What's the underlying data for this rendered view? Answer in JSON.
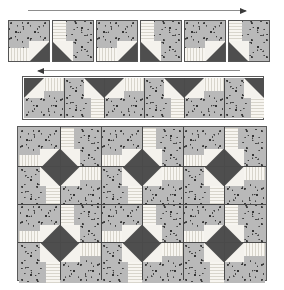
{
  "diagram": {
    "caption": "",
    "fabrics": {
      "print_label": "gray floral print",
      "print_color": "#b9b9b9",
      "stripe_label": "cream stripe",
      "stripe_color": "#f2f0ea",
      "dark_label": "dark gray solid",
      "dark_color": "#4e4e4e",
      "outline_color": "#555555"
    }
  },
  "step1": {
    "name": "single-blocks-row",
    "arrow": {
      "name": "sewing-direction-arrow",
      "direction": "right",
      "label": ""
    },
    "block_count": 6,
    "blocks": [
      {
        "id": "b1",
        "rotation": 0,
        "label": ""
      },
      {
        "id": "b2",
        "rotation": 90,
        "label": ""
      },
      {
        "id": "b3",
        "rotation": 0,
        "label": ""
      },
      {
        "id": "b4",
        "rotation": 90,
        "label": ""
      },
      {
        "id": "b5",
        "rotation": 0,
        "label": ""
      },
      {
        "id": "b6",
        "rotation": 90,
        "label": ""
      }
    ]
  },
  "step2": {
    "name": "joined-pairs-row",
    "arrow": {
      "name": "sewing-direction-arrow",
      "direction": "left",
      "label": ""
    },
    "block_count": 6,
    "pair_count": 3,
    "blocks": [
      {
        "id": "c1",
        "rotation": 180,
        "label": ""
      },
      {
        "id": "c2",
        "rotation": 270,
        "label": ""
      },
      {
        "id": "c3",
        "rotation": 180,
        "label": ""
      },
      {
        "id": "c4",
        "rotation": 270,
        "label": ""
      },
      {
        "id": "c5",
        "rotation": 180,
        "label": ""
      },
      {
        "id": "c6",
        "rotation": 270,
        "label": ""
      }
    ]
  },
  "step3": {
    "name": "assembled-quilt-top",
    "columns": 6,
    "rows": 4,
    "block_count": 24,
    "pinwheel_count": 6,
    "grid": [
      [
        {
          "rotation": 0
        },
        {
          "rotation": 90
        },
        {
          "rotation": 0
        },
        {
          "rotation": 90
        },
        {
          "rotation": 0
        },
        {
          "rotation": 90
        }
      ],
      [
        {
          "rotation": 270
        },
        {
          "rotation": 180
        },
        {
          "rotation": 270
        },
        {
          "rotation": 180
        },
        {
          "rotation": 270
        },
        {
          "rotation": 180
        }
      ],
      [
        {
          "rotation": 0
        },
        {
          "rotation": 90
        },
        {
          "rotation": 0
        },
        {
          "rotation": 90
        },
        {
          "rotation": 0
        },
        {
          "rotation": 90
        }
      ],
      [
        {
          "rotation": 270
        },
        {
          "rotation": 180
        },
        {
          "rotation": 270
        },
        {
          "rotation": 180
        },
        {
          "rotation": 270
        },
        {
          "rotation": 180
        }
      ]
    ]
  }
}
